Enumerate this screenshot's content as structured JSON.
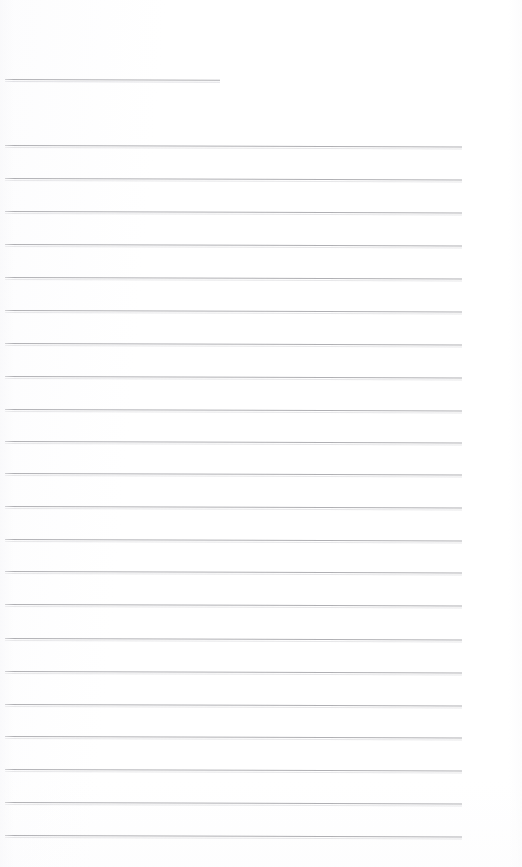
{
  "document": {
    "kind": "scanned-lined-paper",
    "page_width": 522,
    "page_height": 867,
    "background_color": "#ffffff",
    "rule_color": "#a9a9ad",
    "rule_thickness_px": 1,
    "skew_degrees": 0.18,
    "content_text": "",
    "notes_visible": "none"
  },
  "header_rule": {
    "name": "title-blank-rule",
    "x_start": 5,
    "x_end": 220,
    "y": 79,
    "width": 215
  },
  "body_rules": {
    "count": 22,
    "x_start": 5,
    "x_end": 462,
    "width": 457,
    "first_y": 145,
    "spacing": 32.8,
    "lines": [
      {
        "index": 1,
        "y": 145
      },
      {
        "index": 2,
        "y": 178
      },
      {
        "index": 3,
        "y": 211
      },
      {
        "index": 4,
        "y": 244
      },
      {
        "index": 5,
        "y": 277
      },
      {
        "index": 6,
        "y": 310
      },
      {
        "index": 7,
        "y": 343
      },
      {
        "index": 8,
        "y": 376
      },
      {
        "index": 9,
        "y": 409
      },
      {
        "index": 10,
        "y": 441
      },
      {
        "index": 11,
        "y": 473
      },
      {
        "index": 12,
        "y": 506
      },
      {
        "index": 13,
        "y": 539
      },
      {
        "index": 14,
        "y": 571
      },
      {
        "index": 15,
        "y": 604
      },
      {
        "index": 16,
        "y": 638
      },
      {
        "index": 17,
        "y": 671
      },
      {
        "index": 18,
        "y": 704
      },
      {
        "index": 19,
        "y": 736
      },
      {
        "index": 20,
        "y": 769
      },
      {
        "index": 21,
        "y": 802
      },
      {
        "index": 22,
        "y": 835
      }
    ]
  }
}
